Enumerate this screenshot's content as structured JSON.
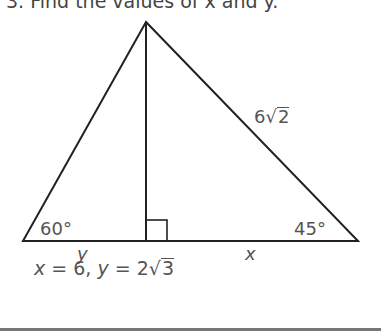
{
  "problem": {
    "header_text": "3. Find the values of x and y."
  },
  "figure": {
    "angle_left": "60°",
    "angle_right": "45°",
    "hypotenuse_label_coef": "6",
    "hypotenuse_label_radicand": "2",
    "base_left_label": "y",
    "base_right_label": "x",
    "right_angle_marker": true
  },
  "answer": {
    "x_var": "x",
    "x_eq": " = 6, ",
    "y_var": "y",
    "y_eq": " = 2",
    "y_radicand": "3"
  }
}
